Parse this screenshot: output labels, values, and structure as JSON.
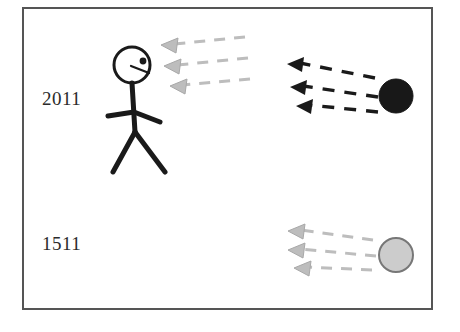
{
  "diagram": {
    "background_color": "#ffffff",
    "frame": {
      "name": "outer-border",
      "x": 22,
      "y": 7,
      "width": 411,
      "height": 303,
      "stroke_color": "#555555",
      "stroke_width": 2
    },
    "labels": [
      {
        "id": "year-2011",
        "text": "2011",
        "x": 42,
        "y": 88,
        "color": "#2b2b2b"
      },
      {
        "id": "year-1511",
        "text": "1511",
        "x": 42,
        "y": 233,
        "color": "#2b2b2b"
      }
    ],
    "observer": {
      "name": "stick-figure-observer",
      "color": "#1a1a1a",
      "head": {
        "cx": 132,
        "cy": 65,
        "r": 18,
        "stroke_width": 3,
        "fill": "#ffffff"
      },
      "eye": {
        "cx": 143,
        "cy": 61,
        "r": 3.4,
        "fill": "#1a1a1a"
      },
      "mouth_line": {
        "x1": 131,
        "y1": 66,
        "x2": 149,
        "y2": 73
      },
      "torso": {
        "x1": 132,
        "y1": 83,
        "x2": 135,
        "y2": 132
      },
      "arm_left": {
        "x1": 134,
        "y1": 112,
        "x2": 108,
        "y2": 116
      },
      "arm_right": {
        "x1": 134,
        "y1": 112,
        "x2": 160,
        "y2": 122
      },
      "leg_left": {
        "x1": 135,
        "y1": 132,
        "x2": 113,
        "y2": 172
      },
      "leg_right": {
        "x1": 135,
        "y1": 132,
        "x2": 165,
        "y2": 172
      }
    },
    "objects": [
      {
        "id": "black-circle-2011",
        "name": "dark-source-circle",
        "cx": 396,
        "cy": 96,
        "r": 17,
        "fill": "#181818",
        "stroke": "#181818",
        "associated_year": "2011"
      },
      {
        "id": "gray-circle-1511",
        "name": "light-source-circle",
        "cx": 396,
        "cy": 255,
        "r": 17,
        "fill": "#cccccc",
        "stroke": "#777777",
        "associated_year": "1511"
      }
    ],
    "ray_groups": [
      {
        "id": "rays-near-observer",
        "name": "faded-light-rays-at-observer",
        "color": "#bdbdbd",
        "direction": "left",
        "rays": [
          {
            "tail_x": 245,
            "tail_y": 37,
            "head_x": 161,
            "head_y": 45
          },
          {
            "tail_x": 248,
            "tail_y": 58,
            "head_x": 164,
            "head_y": 66
          },
          {
            "tail_x": 250,
            "tail_y": 79,
            "head_x": 170,
            "head_y": 86
          }
        ]
      },
      {
        "id": "rays-from-black-circle",
        "name": "dark-light-rays-2011",
        "color": "#1a1a1a",
        "direction": "left",
        "rays": [
          {
            "tail_x": 375,
            "tail_y": 78,
            "head_x": 287,
            "head_y": 64
          },
          {
            "tail_x": 378,
            "tail_y": 97,
            "head_x": 290,
            "head_y": 87
          },
          {
            "tail_x": 378,
            "tail_y": 112,
            "head_x": 296,
            "head_y": 106
          }
        ]
      },
      {
        "id": "rays-from-gray-circle",
        "name": "faded-light-rays-1511",
        "color": "#bdbdbd",
        "direction": "left",
        "rays": [
          {
            "tail_x": 373,
            "tail_y": 240,
            "head_x": 288,
            "head_y": 231
          },
          {
            "tail_x": 376,
            "tail_y": 256,
            "head_x": 288,
            "head_y": 250
          },
          {
            "tail_x": 372,
            "tail_y": 270,
            "head_x": 294,
            "head_y": 268
          }
        ]
      }
    ]
  }
}
